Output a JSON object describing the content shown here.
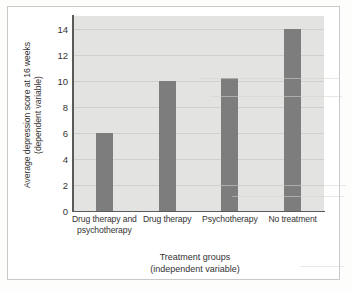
{
  "figure": {
    "background_color": "#ffffff",
    "frame_color": "#c9c9c9",
    "plot_background_color": "#e3e3e1",
    "gridline_color": "#cfcfcd",
    "axis_color": "#5a5a5a",
    "bar_color": "#7d7d7d"
  },
  "chart_data": {
    "type": "bar",
    "title": "",
    "categories": [
      "Drug therapy and psychotherapy",
      "Drug therapy",
      "Psychotherapy",
      "No treatment"
    ],
    "category_lines": [
      [
        "Drug therapy and",
        "psychotherapy"
      ],
      [
        "Drug therapy"
      ],
      [
        "Psychotherapy"
      ],
      [
        "No treatment"
      ]
    ],
    "values": [
      6,
      10,
      10.2,
      14
    ],
    "xlabel": "Treatment groups (independent variable)",
    "xlabel_lines": [
      "Treatment groups",
      "(independent variable)"
    ],
    "ylabel": "Average depression score at 16 weeks (dependent variable)",
    "ylabel_lines": [
      "Average depression score at 16 weeks",
      "(dependent variable)"
    ],
    "ylim": [
      0,
      15
    ],
    "yticks": [
      0,
      2,
      4,
      6,
      8,
      10,
      12,
      14
    ],
    "ytick_labels": [
      "0",
      "2",
      "4",
      "6",
      "8",
      "10",
      "12",
      "14"
    ],
    "grid": true,
    "legend": false,
    "legend_position": "none"
  }
}
